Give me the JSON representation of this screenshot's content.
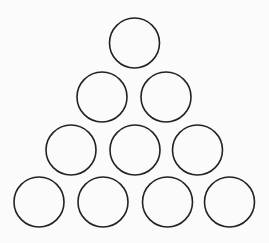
{
  "diagram": {
    "background": "#fbfbfb",
    "stroke_color": "#222222",
    "stroke_width": 1.6,
    "radius": 25,
    "rows": [
      {
        "row": 1,
        "circles": [
          {
            "cx": 134.5,
            "cy": 43
          }
        ]
      },
      {
        "row": 2,
        "circles": [
          {
            "cx": 102,
            "cy": 97
          },
          {
            "cx": 166,
            "cy": 97
          }
        ]
      },
      {
        "row": 3,
        "circles": [
          {
            "cx": 71,
            "cy": 150
          },
          {
            "cx": 135,
            "cy": 150
          },
          {
            "cx": 197.5,
            "cy": 150
          }
        ]
      },
      {
        "row": 4,
        "circles": [
          {
            "cx": 39,
            "cy": 202
          },
          {
            "cx": 103,
            "cy": 202
          },
          {
            "cx": 167.5,
            "cy": 202
          },
          {
            "cx": 229.5,
            "cy": 202
          }
        ]
      }
    ]
  }
}
